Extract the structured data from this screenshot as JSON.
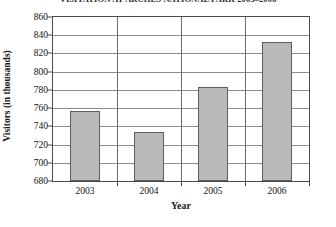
{
  "chart_data": {
    "type": "bar",
    "title": "VISITATION AT ARCHES NATIONAL PARK 2003–2006",
    "xlabel": "Year",
    "ylabel": "Visitors (in thousands)",
    "categories": [
      "2003",
      "2004",
      "2005",
      "2006"
    ],
    "values": [
      757,
      734,
      783,
      833
    ],
    "ylim": [
      680,
      860
    ],
    "ytick_step": 20,
    "yticks": [
      "860",
      "840",
      "820",
      "800",
      "780",
      "760",
      "740",
      "720",
      "700",
      "680"
    ],
    "grid": true,
    "legend": "none",
    "series_color": "#b9b9b9",
    "axis_color": "#4a4a4a",
    "grid_color": "#8d8d8d"
  }
}
